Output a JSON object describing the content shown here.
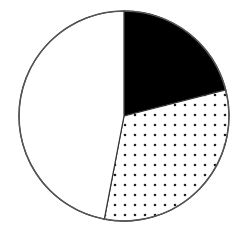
{
  "chart_data": {
    "type": "pie",
    "title": "",
    "start_angle_deg": 0,
    "direction": "clockwise",
    "slices": [
      {
        "label": "",
        "value": 21,
        "fill": "solid",
        "color": "#000000"
      },
      {
        "label": "",
        "value": 32,
        "fill": "dotted",
        "color": "#000000"
      },
      {
        "label": "",
        "value": 47,
        "fill": "none",
        "color": "#ffffff"
      }
    ],
    "legend": [],
    "center": [
      124,
      116
    ],
    "radius": 105,
    "outline_color": "#555555"
  }
}
